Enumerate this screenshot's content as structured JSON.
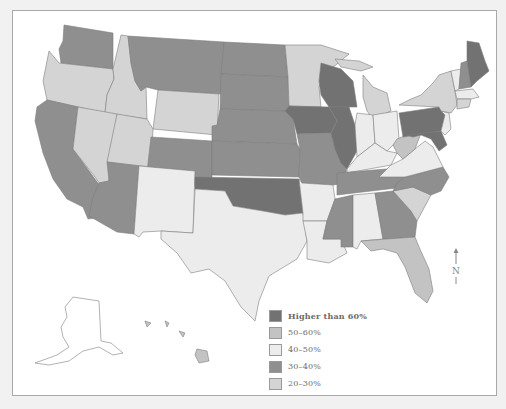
{
  "map": {
    "title_visible": false,
    "region": "United States",
    "colors": {
      "higher_than_60": "#727272",
      "50_60": "#c3c3c3",
      "40_50": "#ececec",
      "30_40": "#8f8f8f",
      "20_30": "#d4d4d4",
      "not_available": "#ffffff",
      "border": "#7d7d7d"
    },
    "states": {
      "WA": "30_40",
      "OR": "20_30",
      "CA": "30_40",
      "ID": "20_30",
      "NV": "20_30",
      "MT": "30_40",
      "WY": "20_30",
      "UT": "20_30",
      "AZ": "30_40",
      "CO": "30_40",
      "NM": "40_50",
      "ND": "30_40",
      "SD": "30_40",
      "NE": "30_40",
      "KS": "30_40",
      "OK": "higher_than_60",
      "TX": "40_50",
      "MN": "20_30",
      "IA": "higher_than_60",
      "MO": "30_40",
      "AR": "40_50",
      "LA": "40_50",
      "WI": "higher_than_60",
      "IL": "higher_than_60",
      "MI": "20_30",
      "IN": "40_50",
      "OH": "40_50",
      "KY": "40_50",
      "TN": "30_40",
      "MS": "30_40",
      "AL": "40_50",
      "GA": "30_40",
      "FL": "50_60",
      "SC": "20_30",
      "NC": "30_40",
      "VA": "40_50",
      "WV": "50_60",
      "PA": "higher_than_60",
      "NY": "20_30",
      "VT": "40_50",
      "NH": "30_40",
      "ME": "higher_than_60",
      "MA": "40_50",
      "CT": "20_30",
      "NJ": "40_50",
      "MD": "higher_than_60",
      "AK": "not_available",
      "HI": "50_60"
    },
    "north_arrow_label": "N"
  },
  "legend": {
    "items": [
      {
        "key": "higher_than_60",
        "label": "Higher than 60%"
      },
      {
        "key": "50_60",
        "label": "50–60%"
      },
      {
        "key": "40_50",
        "label": "40–50%"
      },
      {
        "key": "30_40",
        "label": "30–40%"
      },
      {
        "key": "20_30",
        "label": "20–30%"
      },
      {
        "key": "not_available",
        "label": "Information not available"
      }
    ]
  }
}
